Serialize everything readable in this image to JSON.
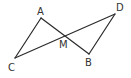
{
  "diagram": {
    "type": "geometry",
    "points": {
      "A": {
        "label": "A",
        "x": 41,
        "y": 18,
        "lx": 37,
        "ly": 15
      },
      "B": {
        "label": "B",
        "x": 89,
        "y": 54,
        "lx": 85,
        "ly": 66
      },
      "C": {
        "label": "C",
        "x": 15,
        "y": 58,
        "lx": 8,
        "ly": 71
      },
      "D": {
        "label": "D",
        "x": 115,
        "y": 14,
        "lx": 116,
        "ly": 11
      },
      "M": {
        "label": "M",
        "x": 65,
        "y": 36,
        "lx": 59,
        "ly": 48
      }
    },
    "segments": [
      {
        "from": "A",
        "to": "C",
        "name": "segment-ac"
      },
      {
        "from": "A",
        "to": "B",
        "name": "segment-ab"
      },
      {
        "from": "C",
        "to": "D",
        "name": "segment-cd"
      },
      {
        "from": "D",
        "to": "B",
        "name": "segment-db"
      }
    ]
  }
}
